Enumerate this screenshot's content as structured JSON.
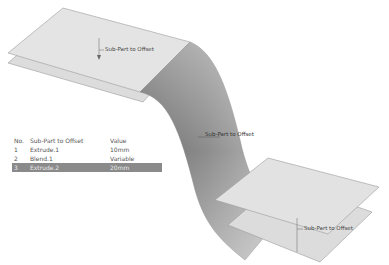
{
  "diagram": {
    "callouts": {
      "top": "Sub-Part to Offset",
      "middle": "Sub-Part to Offset",
      "bottom": "Sub-Part to Offset"
    }
  },
  "table": {
    "headers": {
      "no": "No.",
      "part": "Sub-Part to Offset",
      "value": "Value"
    },
    "rows": [
      {
        "no": "1",
        "part": "Extrude.1",
        "value": "10mm",
        "selected": false
      },
      {
        "no": "2",
        "part": "Blend.1",
        "value": "Variable",
        "selected": false
      },
      {
        "no": "3",
        "part": "Extrude.2",
        "value": "20mm",
        "selected": true
      }
    ],
    "selected_color": "#8a8a8a"
  }
}
